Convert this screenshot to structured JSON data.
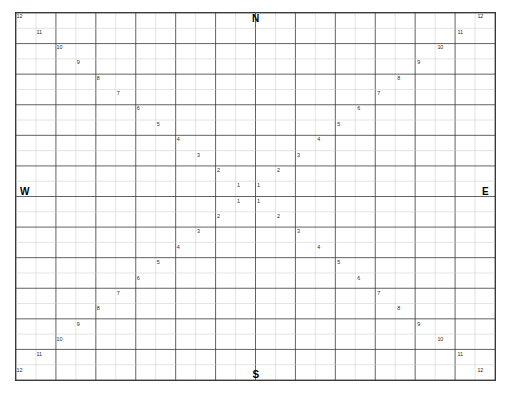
{
  "chart_data": {
    "type": "scatter",
    "title": "",
    "subtitle": "",
    "xlabel": "",
    "ylabel": "",
    "grid": true,
    "legend_position": "none",
    "grid_columns": 24,
    "grid_rows": 24,
    "xlim": [
      -12,
      12
    ],
    "ylim": [
      -12,
      12
    ],
    "ring_values": [
      1,
      2,
      3,
      4,
      5,
      6,
      7,
      8,
      9,
      10,
      11,
      12
    ],
    "series": [
      {
        "name": "northwest-diagonal",
        "values": [
          12,
          11,
          10,
          9,
          8,
          7,
          6,
          5,
          4,
          3,
          2,
          1
        ]
      },
      {
        "name": "northeast-diagonal",
        "values": [
          1,
          2,
          3,
          4,
          5,
          6,
          7,
          8,
          9,
          10,
          11,
          12
        ]
      },
      {
        "name": "southwest-diagonal",
        "values": [
          1,
          2,
          3,
          4,
          5,
          6,
          7,
          8,
          9,
          10,
          11,
          12
        ]
      },
      {
        "name": "southeast-diagonal",
        "values": [
          12,
          11,
          10,
          9,
          8,
          7,
          6,
          5,
          4,
          3,
          2,
          1
        ]
      }
    ],
    "points": [
      {
        "label": "12",
        "col": 0,
        "row": 0
      },
      {
        "label": "11",
        "col": 1,
        "row": 1
      },
      {
        "label": "10",
        "col": 2,
        "row": 2
      },
      {
        "label": "9",
        "col": 3,
        "row": 3
      },
      {
        "label": "8",
        "col": 4,
        "row": 4
      },
      {
        "label": "7",
        "col": 5,
        "row": 5
      },
      {
        "label": "6",
        "col": 6,
        "row": 6
      },
      {
        "label": "5",
        "col": 7,
        "row": 7
      },
      {
        "label": "4",
        "col": 8,
        "row": 8
      },
      {
        "label": "3",
        "col": 9,
        "row": 9
      },
      {
        "label": "2",
        "col": 10,
        "row": 10
      },
      {
        "label": "1",
        "col": 11,
        "row": 11
      },
      {
        "label": "12",
        "col": 23,
        "row": 0
      },
      {
        "label": "11",
        "col": 22,
        "row": 1
      },
      {
        "label": "10",
        "col": 21,
        "row": 2
      },
      {
        "label": "9",
        "col": 20,
        "row": 3
      },
      {
        "label": "8",
        "col": 19,
        "row": 4
      },
      {
        "label": "7",
        "col": 18,
        "row": 5
      },
      {
        "label": "6",
        "col": 17,
        "row": 6
      },
      {
        "label": "5",
        "col": 16,
        "row": 7
      },
      {
        "label": "4",
        "col": 15,
        "row": 8
      },
      {
        "label": "3",
        "col": 14,
        "row": 9
      },
      {
        "label": "2",
        "col": 13,
        "row": 10
      },
      {
        "label": "1",
        "col": 12,
        "row": 11
      },
      {
        "label": "1",
        "col": 11,
        "row": 12
      },
      {
        "label": "2",
        "col": 10,
        "row": 13
      },
      {
        "label": "3",
        "col": 9,
        "row": 14
      },
      {
        "label": "4",
        "col": 8,
        "row": 15
      },
      {
        "label": "5",
        "col": 7,
        "row": 16
      },
      {
        "label": "6",
        "col": 6,
        "row": 17
      },
      {
        "label": "7",
        "col": 5,
        "row": 18
      },
      {
        "label": "8",
        "col": 4,
        "row": 19
      },
      {
        "label": "9",
        "col": 3,
        "row": 20
      },
      {
        "label": "10",
        "col": 2,
        "row": 21
      },
      {
        "label": "11",
        "col": 1,
        "row": 22
      },
      {
        "label": "12",
        "col": 0,
        "row": 23
      },
      {
        "label": "1",
        "col": 12,
        "row": 12
      },
      {
        "label": "2",
        "col": 13,
        "row": 13
      },
      {
        "label": "3",
        "col": 14,
        "row": 14
      },
      {
        "label": "4",
        "col": 15,
        "row": 15
      },
      {
        "label": "5",
        "col": 16,
        "row": 16
      },
      {
        "label": "6",
        "col": 17,
        "row": 17
      },
      {
        "label": "7",
        "col": 18,
        "row": 18
      },
      {
        "label": "8",
        "col": 19,
        "row": 19
      },
      {
        "label": "9",
        "col": 20,
        "row": 20
      },
      {
        "label": "10",
        "col": 21,
        "row": 21
      },
      {
        "label": "11",
        "col": 22,
        "row": 22
      },
      {
        "label": "12",
        "col": 23,
        "row": 23
      }
    ],
    "compass": {
      "north": "N",
      "east": "E",
      "south": "S",
      "west": "W"
    },
    "colors": {
      "background": "#ffffff",
      "minor_gridline": "#c9c9c9",
      "major_gridline": "#3a3a3a",
      "border": "#3a3a3a",
      "number_text": "#2b2b2b",
      "compass_text": "#000000"
    }
  }
}
